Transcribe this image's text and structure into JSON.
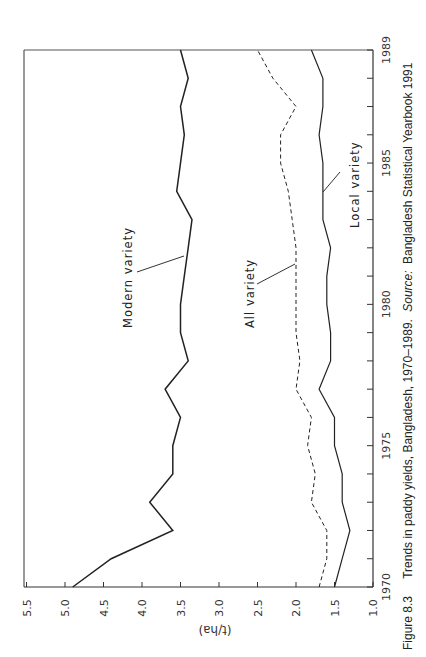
{
  "figure": {
    "number": "Figure 8.3",
    "caption_main": "Trends in paddy yields, Bangladesh, 1970–1989.",
    "caption_source_label": "Source:",
    "caption_source": "Bangladesh Statistical Yearbook 1991"
  },
  "chart_data": {
    "type": "line",
    "title": "Trends in paddy yields, Bangladesh, 1970–1989",
    "xlabel": "",
    "ylabel": "(t/ha)",
    "xlim": [
      1970,
      1989
    ],
    "ylim": [
      1.0,
      5.5
    ],
    "x_tick_labels": [
      "1970",
      "1975",
      "1980",
      "1985",
      "1989"
    ],
    "x_ticks_every_year": true,
    "y_tick_labels": [
      "1.0",
      "1.5",
      "2.0",
      "2.5",
      "3.0",
      "3.5",
      "4.0",
      "4.5",
      "5.0",
      "5.5"
    ],
    "grid": false,
    "orientation": "rotated 90 degrees counter-clockwise",
    "x": [
      1970,
      1971,
      1972,
      1973,
      1974,
      1975,
      1976,
      1977,
      1978,
      1979,
      1980,
      1981,
      1982,
      1983,
      1984,
      1985,
      1986,
      1987,
      1988,
      1989
    ],
    "series": [
      {
        "name": "Modern variety",
        "style": "solid",
        "values": [
          4.9,
          4.4,
          3.6,
          3.9,
          3.6,
          3.6,
          3.5,
          3.7,
          3.4,
          3.5,
          3.5,
          3.45,
          3.4,
          3.35,
          3.55,
          3.5,
          3.45,
          3.5,
          3.4,
          3.5
        ]
      },
      {
        "name": "All variety",
        "style": "dashed",
        "values": [
          1.7,
          1.6,
          1.6,
          1.8,
          1.75,
          1.85,
          1.8,
          2.0,
          1.95,
          2.0,
          2.0,
          2.0,
          2.0,
          2.05,
          2.1,
          2.2,
          2.2,
          2.0,
          2.3,
          2.5
        ]
      },
      {
        "name": "Local variety",
        "style": "solid",
        "values": [
          1.5,
          1.4,
          1.3,
          1.4,
          1.4,
          1.5,
          1.5,
          1.7,
          1.55,
          1.55,
          1.6,
          1.6,
          1.55,
          1.65,
          1.65,
          1.65,
          1.7,
          1.65,
          1.65,
          1.8
        ]
      }
    ],
    "annotations": [
      "Modern variety",
      "All variety",
      "Local variety"
    ]
  }
}
